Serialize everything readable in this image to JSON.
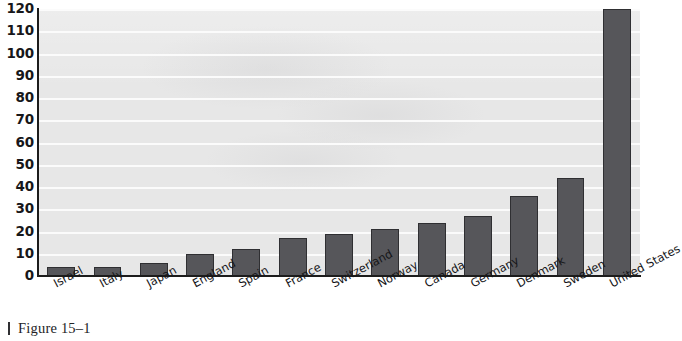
{
  "chart_data": {
    "type": "bar",
    "title": "",
    "xlabel": "",
    "ylabel": "",
    "ylim": [
      0,
      120
    ],
    "yticks": [
      0,
      10,
      20,
      30,
      40,
      50,
      60,
      70,
      80,
      90,
      100,
      110,
      120
    ],
    "grid": true,
    "legend": "none",
    "label_rotation_deg": -28,
    "categories": [
      "Israel",
      "Italy",
      "Japan",
      "England",
      "Spain",
      "France",
      "Switzerland",
      "Norway",
      "Canada",
      "Germany",
      "Denmark",
      "Sweden",
      "United States"
    ],
    "values": [
      4,
      4,
      6,
      10,
      12,
      17,
      19,
      21,
      24,
      27,
      36,
      44,
      120
    ],
    "colors": {
      "bar_fill": "#56565a",
      "bar_edge": "#2f2f32",
      "plot_background": "#e7e7e7",
      "gridline": "#fbfbfb",
      "axis": "#1c1c1c",
      "text": "#151518",
      "page_background": "#ffffff"
    }
  },
  "caption": {
    "text": "Figure 15–1"
  }
}
